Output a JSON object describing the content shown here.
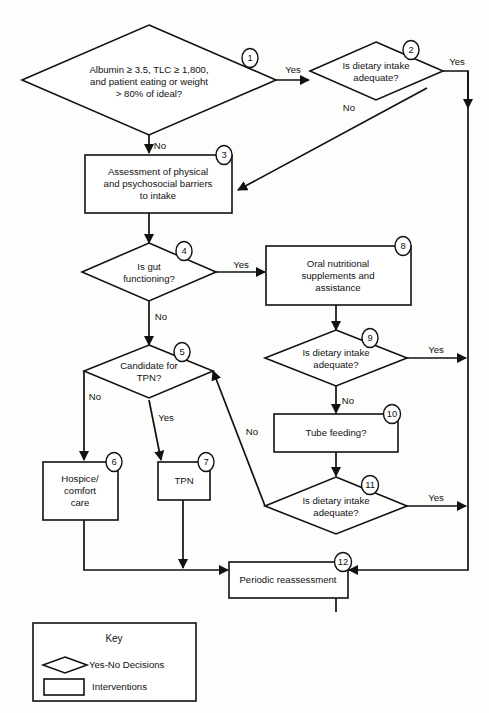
{
  "diagram": {
    "stroke_color": "#111111",
    "fill_color": "#ffffff",
    "background_color": "#fdfdfb"
  },
  "nodes": [
    {
      "id": "1",
      "badge": "1",
      "shape": "decision",
      "lines": [
        "Albumin ≥ 3.5, TLC ≥ 1,800,",
        "and patient eating or weight",
        "> 80% of ideal?"
      ]
    },
    {
      "id": "2",
      "badge": "2",
      "shape": "decision",
      "lines": [
        "Is dietary intake",
        "adequate?"
      ]
    },
    {
      "id": "3",
      "badge": "3",
      "shape": "intervention",
      "lines": [
        "Assessment of physical",
        "and psychosocial barriers",
        "to intake"
      ]
    },
    {
      "id": "4",
      "badge": "4",
      "shape": "decision",
      "lines": [
        "Is gut",
        "functioning?"
      ]
    },
    {
      "id": "5",
      "badge": "5",
      "shape": "decision",
      "lines": [
        "Candidate for",
        "TPN?"
      ]
    },
    {
      "id": "6",
      "badge": "6",
      "shape": "intervention",
      "lines": [
        "Hospice/",
        "comfort",
        "care"
      ]
    },
    {
      "id": "7",
      "badge": "7",
      "shape": "intervention",
      "lines": [
        "TPN"
      ]
    },
    {
      "id": "8",
      "badge": "8",
      "shape": "intervention",
      "lines": [
        "Oral nutritional",
        "supplements and",
        "assistance"
      ]
    },
    {
      "id": "9",
      "badge": "9",
      "shape": "decision",
      "lines": [
        "Is dietary intake",
        "adequate?"
      ]
    },
    {
      "id": "10",
      "badge": "10",
      "shape": "intervention",
      "lines": [
        "Tube feeding?"
      ]
    },
    {
      "id": "11",
      "badge": "11",
      "shape": "decision",
      "lines": [
        "Is dietary intake",
        "adequate?"
      ]
    },
    {
      "id": "12",
      "badge": "12",
      "shape": "intervention",
      "lines": [
        "Periodic reassessment"
      ]
    }
  ],
  "edge_labels": {
    "n1_yes": "Yes",
    "n1_no": "No",
    "n2_yes": "Yes",
    "n2_no": "No",
    "n4_yes": "Yes",
    "n4_no": "No",
    "n5_no": "No",
    "n5_yes": "Yes",
    "n9_yes": "Yes",
    "n9_no": "No",
    "n11_yes": "Yes",
    "n11_no": "No"
  },
  "key": {
    "title": "Key",
    "decision_label": "Yes-No Decisions",
    "intervention_label": "Interventions"
  }
}
